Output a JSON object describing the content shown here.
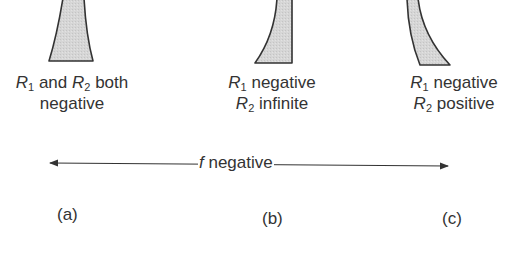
{
  "figure": {
    "lenses": [
      {
        "id": "a",
        "panel_label": "(a)",
        "caption_line1": {
          "r1": "R",
          "r1_sub": "1",
          "mid": " and ",
          "r2": "R",
          "r2_sub": "2",
          "tail": " both"
        },
        "caption_line2": "negative",
        "shape": "biconcave"
      },
      {
        "id": "b",
        "panel_label": "(b)",
        "caption_line1": {
          "r": "R",
          "r_sub": "1",
          "text": " negative"
        },
        "caption_line2": {
          "r": "R",
          "r_sub": "2",
          "text": " infinite"
        },
        "shape": "plano-concave"
      },
      {
        "id": "c",
        "panel_label": "(c)",
        "caption_line1": {
          "r": "R",
          "r_sub": "1",
          "text": " negative"
        },
        "caption_line2": {
          "r": "R",
          "r_sub": "2",
          "text": " positive"
        },
        "shape": "meniscus-diverging"
      }
    ],
    "axis": {
      "symbol": "f",
      "text": " negative"
    },
    "colors": {
      "lens_fill": "#d4d4d4",
      "lens_stroke": "#333333",
      "text": "#333333",
      "background": "#ffffff"
    }
  }
}
